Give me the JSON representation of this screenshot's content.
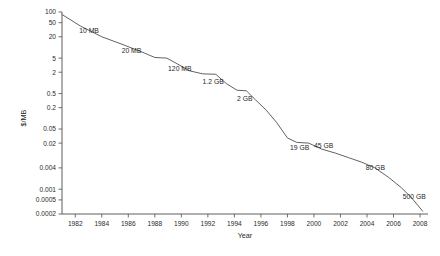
{
  "chart_data": {
    "type": "line",
    "title": "",
    "xlabel": "Year",
    "ylabel": "$/MB",
    "yscale": "log",
    "xlim": [
      1981,
      2008.6
    ],
    "ylim": [
      0.0002,
      100
    ],
    "grid": false,
    "legend": "none",
    "series": [
      {
        "name": "Hard drive cost per megabyte",
        "x": [
          1981.0,
          1982.4,
          1984.0,
          1985.6,
          1987.2,
          1988.0,
          1988.9,
          1989.6,
          1990.6,
          1991.6,
          1992.6,
          1993.4,
          1994.2,
          1994.9,
          1995.6,
          1996.4,
          1997.2,
          1998.0,
          1998.7,
          1999.6,
          2000.6,
          2001.6,
          2002.6,
          2003.6,
          2004.6,
          2005.6,
          2006.6,
          2007.4,
          2008.2
        ],
        "y": [
          85.0,
          40.0,
          20.0,
          12.0,
          7.0,
          5.2,
          5.0,
          3.6,
          2.2,
          1.8,
          1.75,
          0.95,
          0.62,
          0.6,
          0.33,
          0.17,
          0.075,
          0.028,
          0.021,
          0.02,
          0.0135,
          0.0105,
          0.0078,
          0.0058,
          0.004,
          0.0022,
          0.0011,
          0.00055,
          0.00024
        ]
      }
    ],
    "yticks": [
      {
        "value": 100,
        "label": "100"
      },
      {
        "value": 50,
        "label": "50"
      },
      {
        "value": 20,
        "label": "20"
      },
      {
        "value": 5,
        "label": "5"
      },
      {
        "value": 2,
        "label": "2"
      },
      {
        "value": 0.5,
        "label": "0.5"
      },
      {
        "value": 0.2,
        "label": "0.2"
      },
      {
        "value": 0.05,
        "label": "0.05"
      },
      {
        "value": 0.02,
        "label": "0.02"
      },
      {
        "value": 0.004,
        "label": "0.004"
      },
      {
        "value": 0.001,
        "label": "0.001"
      },
      {
        "value": 0.0005,
        "label": "0.0005"
      },
      {
        "value": 0.0002,
        "label": "0.0002"
      }
    ],
    "xticks": [
      {
        "value": 1982,
        "label": "1982"
      },
      {
        "value": 1984,
        "label": "1984"
      },
      {
        "value": 1986,
        "label": "1986"
      },
      {
        "value": 1988,
        "label": "1988"
      },
      {
        "value": 1990,
        "label": "1990"
      },
      {
        "value": 1992,
        "label": "1992"
      },
      {
        "value": 1994,
        "label": "1994"
      },
      {
        "value": 1996,
        "label": "1996"
      },
      {
        "value": 1998,
        "label": "1998"
      },
      {
        "value": 2000,
        "label": "2000"
      },
      {
        "value": 2002,
        "label": "2002"
      },
      {
        "value": 2004,
        "label": "2004"
      },
      {
        "value": 2006,
        "label": "2006"
      },
      {
        "value": 2008,
        "label": "2008"
      }
    ],
    "annotations": [
      {
        "label": "10 MB",
        "x": 1982.3,
        "y": 26.0
      },
      {
        "label": "20 MB",
        "x": 1985.5,
        "y": 7.2
      },
      {
        "label": "120 MB",
        "x": 1989.0,
        "y": 2.2
      },
      {
        "label": "1.2 GB",
        "x": 1991.6,
        "y": 0.95
      },
      {
        "label": "2 GB",
        "x": 1994.2,
        "y": 0.3
      },
      {
        "label": "19 GB",
        "x": 1998.2,
        "y": 0.0125
      },
      {
        "label": "45 GB",
        "x": 2000.0,
        "y": 0.0145
      },
      {
        "label": "80 GB",
        "x": 2003.9,
        "y": 0.0036
      },
      {
        "label": "500 GB",
        "x": 2006.7,
        "y": 0.00052
      }
    ],
    "colors": {
      "line": "#5a5a5a",
      "axis": "#4d4d4d",
      "text": "#1f1f1f",
      "background": "#ffffff"
    }
  }
}
